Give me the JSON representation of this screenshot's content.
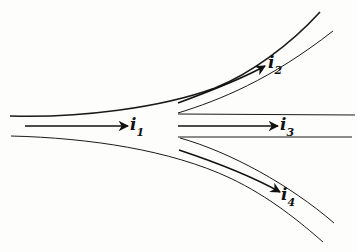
{
  "diagram": {
    "type": "current-branching-junction",
    "colors": {
      "background": "#fdfdfb",
      "ink": "#111111"
    },
    "labels": {
      "i1": {
        "base": "i",
        "sub": "1"
      },
      "i2": {
        "base": "i",
        "sub": "2"
      },
      "i3": {
        "base": "i",
        "sub": "3"
      },
      "i4": {
        "base": "i",
        "sub": "4"
      }
    }
  }
}
